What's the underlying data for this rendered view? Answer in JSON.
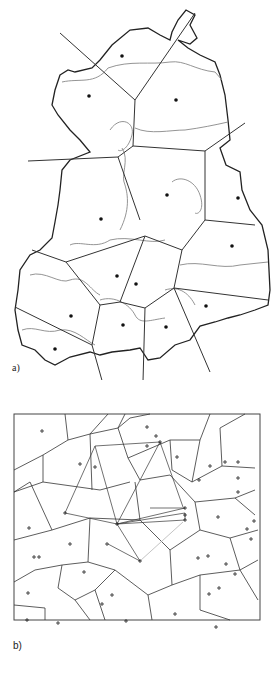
{
  "figure": {
    "panel_a": {
      "label": "a)",
      "description": "Voronoi tessellation overlaid on regional map outline with internal boundaries; dots mark site centers",
      "site_count": 15
    },
    "panel_b": {
      "label": "b)",
      "description": "Voronoi tessellation of a rectangular area; crosses mark sites, with connecting lines between selected sites",
      "site_marker": "+"
    },
    "colors": {
      "outline": "#222222",
      "voronoi_edge": "#333333",
      "internal_boundary": "#888888",
      "background": "#ffffff"
    }
  }
}
